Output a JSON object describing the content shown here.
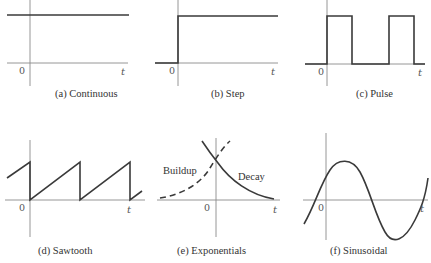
{
  "panels": [
    {
      "id": "a",
      "caption": "(a) Continuous",
      "origin_label": "0",
      "t_label": "t"
    },
    {
      "id": "b",
      "caption": "(b) Step",
      "origin_label": "0",
      "t_label": "t"
    },
    {
      "id": "c",
      "caption": "(c) Pulse",
      "origin_label": "0",
      "t_label": "t"
    },
    {
      "id": "d",
      "caption": "(d) Sawtooth",
      "origin_label": "0",
      "t_label": "t"
    },
    {
      "id": "e",
      "caption": "(e) Exponentials",
      "origin_label": "0",
      "t_label": "t",
      "curve_labels": {
        "buildup": "Buildup",
        "decay": "Decay"
      }
    },
    {
      "id": "f",
      "caption": "(f) Sinusoidal",
      "origin_label": "0",
      "t_label": "t"
    }
  ],
  "colors": {
    "axis": "#8a8a8a",
    "signal": "#3a3a3a",
    "text": "#333333"
  }
}
